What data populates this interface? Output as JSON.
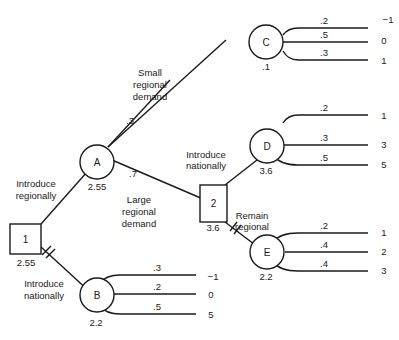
{
  "diagram": {
    "type": "decision-tree",
    "nodes": {
      "n1": {
        "label": "1",
        "shape": "decision",
        "value": "2.55"
      },
      "n2": {
        "label": "2",
        "shape": "decision",
        "value": "3.6"
      },
      "A": {
        "label": "A",
        "shape": "chance",
        "value": "2.55"
      },
      "B": {
        "label": "B",
        "shape": "chance",
        "value": "2.2"
      },
      "C": {
        "label": "C",
        "shape": "chance",
        "value": ".1"
      },
      "D": {
        "label": "D",
        "shape": "chance",
        "value": "3.6"
      },
      "E": {
        "label": "E",
        "shape": "chance",
        "value": "2.2"
      }
    },
    "edges": {
      "n1_A": {
        "label_line1": "Introduce",
        "label_line2": "regionally"
      },
      "n1_B": {
        "label_line1": "Introduce",
        "label_line2": "nationally",
        "pruned": true
      },
      "A_C": {
        "prob": ".3",
        "label_line1": "Small",
        "label_line2": "regional",
        "label_line3": "demand"
      },
      "A_2": {
        "prob": ".7",
        "label_line1": "Large",
        "label_line2": "regional",
        "label_line3": "demand"
      },
      "n2_D": {
        "label_line1": "Introduce",
        "label_line2": "nationally"
      },
      "n2_E": {
        "label_line1": "Remain",
        "label_line2": "regional",
        "pruned": true
      }
    },
    "outcomes": {
      "C": [
        {
          "prob": ".2",
          "payoff": "−1"
        },
        {
          "prob": ".5",
          "payoff": "0"
        },
        {
          "prob": ".3",
          "payoff": "1"
        }
      ],
      "D": [
        {
          "prob": ".2",
          "payoff": "1"
        },
        {
          "prob": ".3",
          "payoff": "3"
        },
        {
          "prob": ".5",
          "payoff": "5"
        }
      ],
      "E": [
        {
          "prob": ".2",
          "payoff": "1"
        },
        {
          "prob": ".4",
          "payoff": "2"
        },
        {
          "prob": ".4",
          "payoff": "3"
        }
      ],
      "B": [
        {
          "prob": ".3",
          "payoff": "−1"
        },
        {
          "prob": ".2",
          "payoff": "0"
        },
        {
          "prob": ".5",
          "payoff": "5"
        }
      ]
    }
  }
}
